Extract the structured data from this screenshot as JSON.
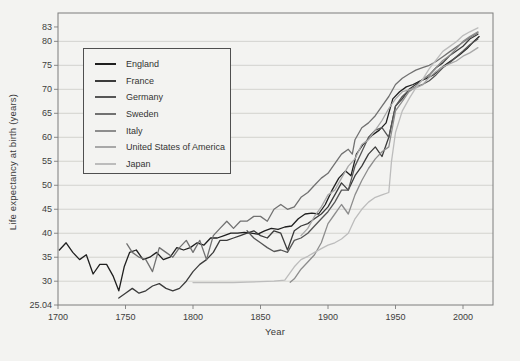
{
  "figure": {
    "background": "#f3f3f1"
  },
  "chart_data": {
    "type": "line",
    "title": "",
    "xlabel": "Year",
    "ylabel": "Life expectancy at birth (years)",
    "xlim": [
      1700,
      2022
    ],
    "ylim": [
      25.04,
      83
    ],
    "x_ticks": [
      1700,
      1750,
      1800,
      1850,
      1900,
      1950,
      2000
    ],
    "y_ticks": [
      25.04,
      30,
      35,
      40,
      45,
      50,
      55,
      60,
      65,
      70,
      75,
      80,
      83
    ],
    "grid": "horizontal",
    "gridline_color": "#cfcfcb",
    "frame_color": "#7d7d7d",
    "legend_position": "top-left",
    "legend_entries": [
      "England",
      "France",
      "Germany",
      "Sweden",
      "Italy",
      "United States of America",
      "Japan"
    ],
    "series": [
      {
        "name": "England",
        "color": "#1f1f1f",
        "points": [
          [
            1701,
            36.5
          ],
          [
            1706,
            38
          ],
          [
            1711,
            36
          ],
          [
            1716,
            34.5
          ],
          [
            1721,
            35.5
          ],
          [
            1726,
            31.5
          ],
          [
            1731,
            33.5
          ],
          [
            1736,
            33.5
          ],
          [
            1741,
            31
          ],
          [
            1745,
            28
          ],
          [
            1749,
            33
          ],
          [
            1753,
            36
          ],
          [
            1758,
            36.5
          ],
          [
            1763,
            34.5
          ],
          [
            1768,
            35
          ],
          [
            1773,
            36
          ],
          [
            1778,
            34.5
          ],
          [
            1783,
            35
          ],
          [
            1788,
            37
          ],
          [
            1793,
            36.5
          ],
          [
            1798,
            37
          ],
          [
            1803,
            38
          ],
          [
            1808,
            37.5
          ],
          [
            1813,
            39
          ],
          [
            1818,
            39
          ],
          [
            1823,
            39.5
          ],
          [
            1828,
            40
          ],
          [
            1833,
            40
          ],
          [
            1838,
            40.2
          ],
          [
            1843,
            40
          ],
          [
            1848,
            39.8
          ],
          [
            1853,
            40.5
          ],
          [
            1858,
            41
          ],
          [
            1863,
            40.8
          ],
          [
            1868,
            41.3
          ],
          [
            1873,
            41.5
          ],
          [
            1878,
            43
          ],
          [
            1883,
            44
          ],
          [
            1888,
            44.2
          ],
          [
            1893,
            44
          ],
          [
            1898,
            46
          ],
          [
            1903,
            49
          ],
          [
            1908,
            51.5
          ],
          [
            1913,
            53
          ],
          [
            1917,
            52
          ],
          [
            1921,
            56.5
          ],
          [
            1926,
            58.5
          ],
          [
            1933,
            60.5
          ],
          [
            1938,
            61.5
          ],
          [
            1943,
            63
          ],
          [
            1948,
            68
          ],
          [
            1953,
            69.5
          ],
          [
            1958,
            70.5
          ],
          [
            1963,
            71
          ],
          [
            1968,
            71.7
          ],
          [
            1973,
            72.3
          ],
          [
            1978,
            73
          ],
          [
            1983,
            74.3
          ],
          [
            1988,
            75.3
          ],
          [
            1993,
            76.3
          ],
          [
            1998,
            77.3
          ],
          [
            2003,
            78.5
          ],
          [
            2008,
            80
          ],
          [
            2012,
            81
          ]
        ]
      },
      {
        "name": "France",
        "color": "#3b3b3b",
        "points": [
          [
            1745,
            26.5
          ],
          [
            1750,
            27.5
          ],
          [
            1755,
            28.5
          ],
          [
            1760,
            27.5
          ],
          [
            1765,
            28
          ],
          [
            1770,
            29
          ],
          [
            1775,
            29.5
          ],
          [
            1780,
            28.5
          ],
          [
            1785,
            28
          ],
          [
            1790,
            28.5
          ],
          [
            1795,
            30
          ],
          [
            1800,
            32
          ],
          [
            1805,
            33.5
          ],
          [
            1810,
            34.5
          ],
          [
            1815,
            36
          ],
          [
            1820,
            38.5
          ],
          [
            1825,
            38.5
          ],
          [
            1830,
            39
          ],
          [
            1835,
            39.5
          ],
          [
            1840,
            40
          ],
          [
            1845,
            40.5
          ],
          [
            1850,
            39.5
          ],
          [
            1855,
            39
          ],
          [
            1860,
            40.5
          ],
          [
            1865,
            40
          ],
          [
            1870,
            36.5
          ],
          [
            1875,
            40.5
          ],
          [
            1880,
            41.5
          ],
          [
            1885,
            42
          ],
          [
            1890,
            43
          ],
          [
            1895,
            44
          ],
          [
            1900,
            45.5
          ],
          [
            1905,
            48
          ],
          [
            1910,
            50.5
          ],
          [
            1915,
            49
          ],
          [
            1920,
            52
          ],
          [
            1925,
            54
          ],
          [
            1930,
            56.5
          ],
          [
            1935,
            58
          ],
          [
            1940,
            56
          ],
          [
            1945,
            60
          ],
          [
            1950,
            66.5
          ],
          [
            1955,
            68
          ],
          [
            1960,
            70
          ],
          [
            1965,
            71
          ],
          [
            1970,
            72
          ],
          [
            1975,
            73
          ],
          [
            1980,
            74.5
          ],
          [
            1985,
            75.5
          ],
          [
            1990,
            77
          ],
          [
            1995,
            78
          ],
          [
            2000,
            79
          ],
          [
            2005,
            80.5
          ],
          [
            2011,
            81.5
          ]
        ]
      },
      {
        "name": "Germany",
        "color": "#565656",
        "points": [
          [
            1840,
            40.5
          ],
          [
            1845,
            39
          ],
          [
            1850,
            38
          ],
          [
            1855,
            37
          ],
          [
            1860,
            36.2
          ],
          [
            1865,
            36.5
          ],
          [
            1870,
            36
          ],
          [
            1875,
            38.5
          ],
          [
            1880,
            39
          ],
          [
            1885,
            40
          ],
          [
            1890,
            41.5
          ],
          [
            1895,
            43
          ],
          [
            1900,
            44.5
          ],
          [
            1905,
            46.5
          ],
          [
            1910,
            49
          ],
          [
            1915,
            49
          ],
          [
            1920,
            54
          ],
          [
            1925,
            57
          ],
          [
            1930,
            60
          ],
          [
            1935,
            61.5
          ],
          [
            1940,
            62
          ],
          [
            1945,
            60
          ],
          [
            1950,
            66.5
          ],
          [
            1955,
            68.5
          ],
          [
            1960,
            69.8
          ],
          [
            1965,
            70.5
          ],
          [
            1970,
            71
          ],
          [
            1975,
            71.8
          ],
          [
            1980,
            73
          ],
          [
            1985,
            74.5
          ],
          [
            1990,
            75.5
          ],
          [
            1995,
            76.8
          ],
          [
            2000,
            78
          ],
          [
            2005,
            79.3
          ],
          [
            2011,
            80.5
          ]
        ]
      },
      {
        "name": "Sweden",
        "color": "#717171",
        "points": [
          [
            1751,
            37.8
          ],
          [
            1755,
            36
          ],
          [
            1760,
            35
          ],
          [
            1765,
            34.5
          ],
          [
            1770,
            32
          ],
          [
            1775,
            37
          ],
          [
            1780,
            36
          ],
          [
            1785,
            35
          ],
          [
            1790,
            37
          ],
          [
            1795,
            38.5
          ],
          [
            1800,
            36
          ],
          [
            1805,
            38.5
          ],
          [
            1810,
            34.5
          ],
          [
            1815,
            39.5
          ],
          [
            1820,
            41
          ],
          [
            1825,
            42.5
          ],
          [
            1830,
            41
          ],
          [
            1835,
            42.5
          ],
          [
            1840,
            42.5
          ],
          [
            1845,
            43.5
          ],
          [
            1850,
            43.5
          ],
          [
            1855,
            42.5
          ],
          [
            1860,
            45
          ],
          [
            1865,
            46
          ],
          [
            1870,
            45
          ],
          [
            1875,
            45.5
          ],
          [
            1880,
            47.5
          ],
          [
            1885,
            48.5
          ],
          [
            1890,
            50
          ],
          [
            1895,
            51.5
          ],
          [
            1900,
            52.5
          ],
          [
            1905,
            54.5
          ],
          [
            1910,
            56.5
          ],
          [
            1915,
            57.5
          ],
          [
            1918,
            56.5
          ],
          [
            1920,
            59.5
          ],
          [
            1925,
            62
          ],
          [
            1930,
            63
          ],
          [
            1935,
            64.5
          ],
          [
            1940,
            66.5
          ],
          [
            1945,
            68.5
          ],
          [
            1950,
            71
          ],
          [
            1955,
            72.3
          ],
          [
            1960,
            73.2
          ],
          [
            1965,
            74
          ],
          [
            1970,
            74.5
          ],
          [
            1975,
            75
          ],
          [
            1980,
            75.8
          ],
          [
            1985,
            76.8
          ],
          [
            1990,
            77.8
          ],
          [
            1995,
            78.8
          ],
          [
            2000,
            79.8
          ],
          [
            2005,
            80.8
          ],
          [
            2011,
            81.8
          ]
        ]
      },
      {
        "name": "Italy",
        "color": "#8d8d8d",
        "points": [
          [
            1872,
            29.8
          ],
          [
            1875,
            30.5
          ],
          [
            1880,
            32.5
          ],
          [
            1885,
            34
          ],
          [
            1890,
            35.5
          ],
          [
            1895,
            38
          ],
          [
            1900,
            42
          ],
          [
            1905,
            44
          ],
          [
            1910,
            46
          ],
          [
            1915,
            44
          ],
          [
            1920,
            48
          ],
          [
            1925,
            51
          ],
          [
            1930,
            53.5
          ],
          [
            1935,
            55.5
          ],
          [
            1940,
            57
          ],
          [
            1945,
            58
          ],
          [
            1950,
            65.5
          ],
          [
            1955,
            67.5
          ],
          [
            1960,
            69.5
          ],
          [
            1965,
            70.5
          ],
          [
            1970,
            72
          ],
          [
            1975,
            73
          ],
          [
            1980,
            74.5
          ],
          [
            1985,
            76
          ],
          [
            1990,
            77
          ],
          [
            1995,
            78.5
          ],
          [
            2000,
            80
          ],
          [
            2005,
            81
          ],
          [
            2011,
            82
          ]
        ]
      },
      {
        "name": "United States of America",
        "color": "#a8a8a8",
        "points": [
          [
            1880,
            39.5
          ],
          [
            1885,
            41
          ],
          [
            1890,
            43.5
          ],
          [
            1895,
            45.5
          ],
          [
            1900,
            48
          ],
          [
            1905,
            49
          ],
          [
            1910,
            51.5
          ],
          [
            1915,
            54
          ],
          [
            1920,
            55.5
          ],
          [
            1925,
            58.5
          ],
          [
            1930,
            59.5
          ],
          [
            1935,
            61.5
          ],
          [
            1940,
            63.5
          ],
          [
            1945,
            66
          ],
          [
            1950,
            68
          ],
          [
            1955,
            69.5
          ],
          [
            1960,
            69.9
          ],
          [
            1965,
            70.3
          ],
          [
            1970,
            70.9
          ],
          [
            1975,
            72.5
          ],
          [
            1980,
            73.7
          ],
          [
            1985,
            74.7
          ],
          [
            1990,
            75.3
          ],
          [
            1995,
            75.9
          ],
          [
            2000,
            76.9
          ],
          [
            2005,
            77.6
          ],
          [
            2011,
            78.7
          ]
        ]
      },
      {
        "name": "Japan",
        "color": "#bcbcbc",
        "points": [
          [
            1800,
            29.7
          ],
          [
            1810,
            29.7
          ],
          [
            1820,
            29.7
          ],
          [
            1830,
            29.7
          ],
          [
            1840,
            29.8
          ],
          [
            1850,
            29.9
          ],
          [
            1860,
            30
          ],
          [
            1868,
            30.2
          ],
          [
            1875,
            33
          ],
          [
            1880,
            34.5
          ],
          [
            1885,
            35.2
          ],
          [
            1890,
            36
          ],
          [
            1895,
            36.8
          ],
          [
            1900,
            37.5
          ],
          [
            1905,
            38
          ],
          [
            1910,
            38.8
          ],
          [
            1915,
            40
          ],
          [
            1920,
            43
          ],
          [
            1925,
            45
          ],
          [
            1930,
            46.5
          ],
          [
            1935,
            47.5
          ],
          [
            1940,
            48
          ],
          [
            1945,
            48.5
          ],
          [
            1947,
            55
          ],
          [
            1950,
            61
          ],
          [
            1955,
            65.5
          ],
          [
            1960,
            68
          ],
          [
            1965,
            70.3
          ],
          [
            1970,
            72
          ],
          [
            1975,
            74.3
          ],
          [
            1980,
            76.1
          ],
          [
            1985,
            77.9
          ],
          [
            1990,
            78.9
          ],
          [
            1995,
            79.9
          ],
          [
            2000,
            81.2
          ],
          [
            2005,
            82
          ],
          [
            2011,
            82.8
          ]
        ]
      }
    ]
  }
}
